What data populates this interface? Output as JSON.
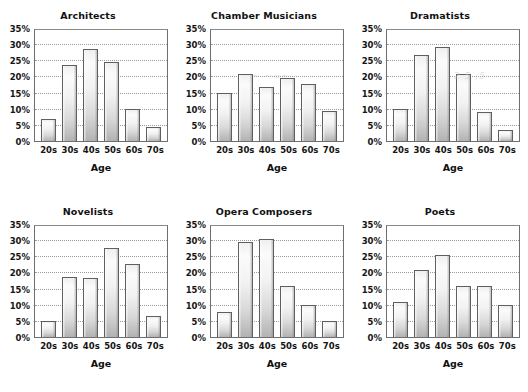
{
  "figure": {
    "layout": "2x3 grid of small multiple bar charts",
    "background_color": "#ffffff",
    "bar_fill_color": "#e8e8e8",
    "bar_edge_color": "#5f5f5f",
    "gridline_color": "#9b9b9b",
    "axis_color": "#6e6e6e",
    "text_color": "#141414"
  },
  "axis": {
    "x_title": "Age",
    "categories": [
      "20s",
      "30s",
      "40s",
      "50s",
      "60s",
      "70s"
    ],
    "y_ticks": [
      "35%",
      "30%",
      "25%",
      "20%",
      "15%",
      "10%",
      "5%",
      "0%"
    ],
    "y_tick_values": [
      35,
      30,
      25,
      20,
      15,
      10,
      5,
      0
    ],
    "y_min": 0,
    "y_max": 35
  },
  "artifacts": [
    {
      "panel": "chamber-musicians",
      "text": "~ ~=~"
    },
    {
      "panel": "dramatists",
      "text": "2 5 ;5"
    }
  ],
  "chart_data": [
    {
      "type": "bar",
      "title": "Architects",
      "xlabel": "Age",
      "ylabel": "",
      "categories": [
        "20s",
        "30s",
        "40s",
        "50s",
        "60s",
        "70s"
      ],
      "values": [
        7,
        24,
        29,
        25,
        10,
        4.5
      ],
      "ylim": [
        0,
        35
      ],
      "grid": true,
      "legend": "none"
    },
    {
      "type": "bar",
      "title": "Chamber Musicians",
      "xlabel": "Age",
      "ylabel": "",
      "categories": [
        "20s",
        "30s",
        "40s",
        "50s",
        "60s",
        "70s"
      ],
      "values": [
        15,
        21,
        17,
        20,
        18,
        9.5
      ],
      "ylim": [
        0,
        35
      ],
      "grid": true,
      "legend": "none"
    },
    {
      "type": "bar",
      "title": "Dramatists",
      "xlabel": "Age",
      "ylabel": "",
      "categories": [
        "20s",
        "30s",
        "40s",
        "50s",
        "60s",
        "70s"
      ],
      "values": [
        10,
        27,
        29.5,
        21,
        9,
        3.5
      ],
      "ylim": [
        0,
        35
      ],
      "grid": true,
      "legend": "none"
    },
    {
      "type": "bar",
      "title": "Novelists",
      "xlabel": "Age",
      "ylabel": "",
      "categories": [
        "20s",
        "30s",
        "40s",
        "50s",
        "60s",
        "70s"
      ],
      "values": [
        5,
        19,
        18.5,
        28,
        23,
        6.5
      ],
      "ylim": [
        0,
        35
      ],
      "grid": true,
      "legend": "none"
    },
    {
      "type": "bar",
      "title": "Opera Composers",
      "xlabel": "Age",
      "ylabel": "",
      "categories": [
        "20s",
        "30s",
        "40s",
        "50s",
        "60s",
        "70s"
      ],
      "values": [
        8,
        30,
        31,
        16,
        10,
        5
      ],
      "ylim": [
        0,
        35
      ],
      "grid": true,
      "legend": "none"
    },
    {
      "type": "bar",
      "title": "Poets",
      "xlabel": "Age",
      "ylabel": "",
      "categories": [
        "20s",
        "30s",
        "40s",
        "50s",
        "60s",
        "70s"
      ],
      "values": [
        11,
        21,
        26,
        16,
        16,
        10
      ],
      "ylim": [
        0,
        35
      ],
      "grid": true,
      "legend": "none"
    }
  ]
}
